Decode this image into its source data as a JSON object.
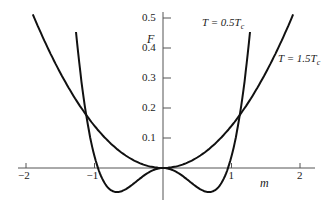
{
  "chart_data": {
    "type": "line",
    "title": "",
    "xlabel": "m",
    "ylabel": "F",
    "xlim": [
      -2.1,
      2.1
    ],
    "ylim": [
      -0.12,
      0.52
    ],
    "x_ticks": [
      -2,
      -1,
      1,
      2
    ],
    "x_tick_labels": [
      "−2",
      "−1",
      "1",
      "2"
    ],
    "y_ticks": [
      0.1,
      0.2,
      0.3,
      0.4,
      0.5
    ],
    "y_tick_labels": [
      "0.1",
      "0.2",
      "0.3",
      "0.4",
      "0.5"
    ],
    "grid": false,
    "series": [
      {
        "name": "T = 0.5T_c",
        "label_main": "T = 0.5T",
        "label_sub": "c",
        "formula": "F = 0.395 m^4 - 0.356 m^2",
        "a4": 0.395,
        "a2": -0.356,
        "x_range": [
          -1.27,
          1.27
        ]
      },
      {
        "name": "T = 1.5T_c",
        "label_main": "T = 1.5T",
        "label_sub": "c",
        "formula": "F = 0.14 m^2",
        "a4": 0.0005,
        "a2": 0.14,
        "x_range": [
          -1.9,
          1.9
        ]
      }
    ],
    "annotations": [
      "T = 0.5T_c",
      "T = 1.5T_c"
    ]
  }
}
